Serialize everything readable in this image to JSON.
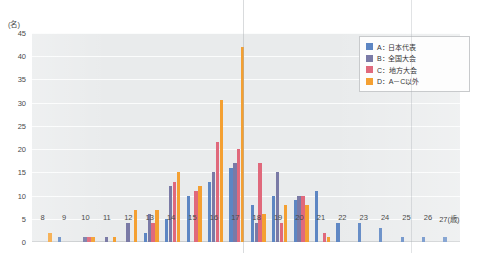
{
  "chart_data": {
    "type": "bar",
    "title": "",
    "xlabel": "(歳)",
    "ylabel": "(名)",
    "ylim": [
      0,
      45
    ],
    "yticks": [
      0,
      5,
      10,
      15,
      20,
      25,
      30,
      35,
      40,
      45
    ],
    "grid": true,
    "legend_position": "top-right",
    "categories": [
      "8",
      "9",
      "10",
      "11",
      "12",
      "13",
      "14",
      "15",
      "16",
      "17",
      "18",
      "19",
      "20",
      "21",
      "22",
      "23",
      "24",
      "25",
      "26",
      "27"
    ],
    "series": [
      {
        "name": "A：日本代表",
        "color": "#5d86c3",
        "values": [
          0,
          1,
          0,
          0,
          0,
          2,
          5,
          10,
          13,
          16,
          8,
          10,
          9,
          11,
          4,
          4,
          3,
          1,
          1,
          1
        ]
      },
      {
        "name": "B：全国大会",
        "color": "#7a7aa6",
        "values": [
          0,
          0,
          1,
          1,
          4,
          6,
          12,
          0,
          15,
          17,
          4,
          15,
          10,
          0,
          0,
          0,
          0,
          0,
          0,
          0
        ]
      },
      {
        "name": "C：地方大会",
        "color": "#e0697c",
        "values": [
          0,
          0,
          1,
          0,
          0,
          4,
          13,
          11,
          21.5,
          20,
          17,
          4,
          10,
          2,
          0,
          0,
          0,
          0,
          0,
          0
        ]
      },
      {
        "name": "D：A－C以外",
        "color": "#f4a032",
        "values": [
          2,
          0,
          1,
          1,
          7,
          7,
          15,
          12,
          30.5,
          42,
          6,
          8,
          8,
          1,
          0,
          0,
          0,
          0,
          0,
          0
        ]
      }
    ]
  },
  "legend": {
    "items": [
      {
        "label": "A：日本代表"
      },
      {
        "label": "B：全国大会"
      },
      {
        "label": "C：地方大会"
      },
      {
        "label": "D：A－C以外"
      }
    ]
  },
  "axes": {
    "y_unit": "(名)",
    "x_unit": "(歳)"
  },
  "caption": ""
}
